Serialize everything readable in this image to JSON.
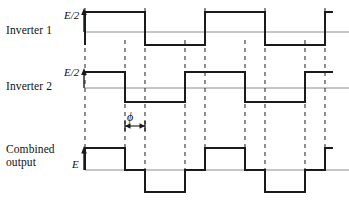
{
  "figure": {
    "type": "waveform-timing-diagram",
    "background": "#ffffff",
    "trace_color": "#1a1a1a",
    "axis_color": "#8c8c8c",
    "dash_color": "#333333"
  },
  "rows": [
    {
      "id": "inverter-1",
      "label": "Inverter 1",
      "amplitude_label": "E/2",
      "baseline_y": 32,
      "high_y": 12,
      "low_y": 45,
      "axis_x1": 85,
      "axis_x2": 349,
      "start_level": "low",
      "transitions": [
        85,
        145,
        205,
        265,
        325
      ]
    },
    {
      "id": "inverter-2",
      "label": "Inverter 2",
      "amplitude_label": "E/2",
      "baseline_y": 88,
      "high_y": 72,
      "low_y": 102,
      "axis_x1": 85,
      "axis_x2": 349,
      "start_level": "high",
      "transitions": [
        125,
        185,
        245,
        305
      ]
    },
    {
      "id": "combined-output",
      "label": "Combined\noutput",
      "amplitude_label": "E",
      "baseline_y": 170,
      "high_y": 148,
      "low_y": 192,
      "axis_x1": 85,
      "axis_x2": 349,
      "levels": [
        {
          "from": 85,
          "to": 125,
          "level": "+E"
        },
        {
          "from": 125,
          "to": 145,
          "level": "0"
        },
        {
          "from": 145,
          "to": 185,
          "level": "-E"
        },
        {
          "from": 185,
          "to": 205,
          "level": "0"
        },
        {
          "from": 205,
          "to": 245,
          "level": "+E"
        },
        {
          "from": 245,
          "to": 265,
          "level": "0"
        },
        {
          "from": 265,
          "to": 305,
          "level": "-E"
        },
        {
          "from": 305,
          "to": 325,
          "level": "0"
        },
        {
          "from": 325,
          "to": 333,
          "level": "+E"
        }
      ]
    }
  ],
  "dashed_gridlines": [
    {
      "x": 85,
      "y1": 8,
      "y2": 170
    },
    {
      "x": 125,
      "y1": 40,
      "y2": 170
    },
    {
      "x": 145,
      "y1": 8,
      "y2": 170
    },
    {
      "x": 185,
      "y1": 40,
      "y2": 170
    },
    {
      "x": 205,
      "y1": 8,
      "y2": 170
    },
    {
      "x": 245,
      "y1": 40,
      "y2": 170
    },
    {
      "x": 265,
      "y1": 8,
      "y2": 170
    },
    {
      "x": 305,
      "y1": 40,
      "y2": 170
    },
    {
      "x": 325,
      "y1": 8,
      "y2": 170
    }
  ],
  "phase_annotation": {
    "symbol": "ϕ",
    "from_x": 125,
    "to_x": 145,
    "y": 126
  },
  "chart_data": {
    "type": "line",
    "title": "",
    "xlabel": "",
    "ylabel": "",
    "series": [
      {
        "name": "Inverter 1",
        "unit": "E/2",
        "x": [
          85,
          85,
          145,
          145,
          205,
          205,
          265,
          265,
          325,
          325,
          333
        ],
        "y": [
          -1,
          1,
          1,
          -1,
          -1,
          1,
          1,
          -1,
          -1,
          1,
          1
        ]
      },
      {
        "name": "Inverter 2",
        "unit": "E/2",
        "x": [
          85,
          125,
          125,
          185,
          185,
          245,
          245,
          305,
          305,
          333
        ],
        "y": [
          1,
          1,
          -1,
          -1,
          1,
          1,
          -1,
          -1,
          1,
          1
        ]
      },
      {
        "name": "Combined output",
        "unit": "E",
        "x": [
          85,
          85,
          125,
          125,
          145,
          145,
          185,
          185,
          205,
          205,
          245,
          245,
          265,
          265,
          305,
          305,
          325,
          325,
          333
        ],
        "y": [
          0,
          1,
          1,
          0,
          0,
          -1,
          -1,
          0,
          0,
          1,
          1,
          0,
          0,
          -1,
          -1,
          0,
          0,
          1,
          1
        ]
      }
    ]
  }
}
